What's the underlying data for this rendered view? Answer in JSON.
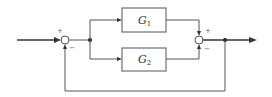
{
  "diagram": {
    "type": "block-diagram",
    "blocks": [
      {
        "id": "G1",
        "label": "G",
        "subscript": "1"
      },
      {
        "id": "G2",
        "label": "G",
        "subscript": "2"
      }
    ],
    "summing_junctions": [
      {
        "id": "sum1",
        "signs": {
          "input": "+",
          "feedback": "−"
        }
      },
      {
        "id": "sum2",
        "signs": {
          "top": "+",
          "bottom": "−"
        }
      }
    ],
    "signs": {
      "sum1_plus": "+",
      "sum1_minus": "−",
      "sum2_plus": "+",
      "sum2_minus": "−"
    },
    "connections": [
      "input → sum1 (+)",
      "sum1 → branch point",
      "branch point → G1",
      "branch point → G2",
      "G1 → sum2 (+)",
      "G2 → sum2 (−)",
      "sum2 → output",
      "output → feedback → sum1 (−)"
    ]
  }
}
